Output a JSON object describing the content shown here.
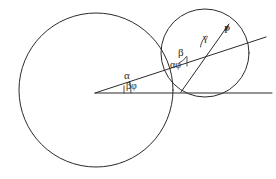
{
  "figure": {
    "background_color": "#ffffff",
    "stroke_color": "#2b2b2b",
    "width": 276,
    "height": 179,
    "labels": {
      "alpha": "α",
      "beta_phi": "βφ",
      "beta": "β",
      "alpha_phi": "αφ",
      "gamma": "γ",
      "point_p": "P"
    },
    "shapes": {
      "large_circle": {
        "cx": 96,
        "cy": 90,
        "r": 77,
        "name": "large-circle"
      },
      "small_circle": {
        "cx": 205,
        "cy": 53,
        "r": 44,
        "name": "small-circle"
      },
      "vertex": {
        "x": 95,
        "y": 93
      },
      "horizontal_line": {
        "x1": 95,
        "y1": 93,
        "x2": 272,
        "y2": 93
      },
      "slanted_line": {
        "x1": 95,
        "y1": 93,
        "x2": 266,
        "y2": 37
      },
      "chord_line": {
        "x1": 181,
        "y1": 92,
        "x2": 228,
        "y2": 25
      }
    }
  }
}
